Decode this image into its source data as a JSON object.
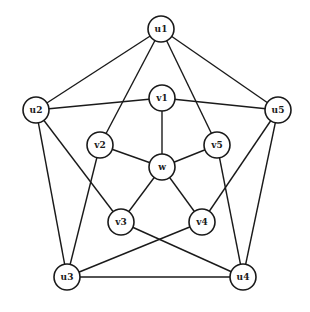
{
  "graph": {
    "node_radius": 13,
    "nodes": [
      {
        "id": "u1",
        "label": "u1",
        "x": 161,
        "y": 29
      },
      {
        "id": "u2",
        "label": "u2",
        "x": 36,
        "y": 110
      },
      {
        "id": "u5",
        "label": "u5",
        "x": 278,
        "y": 110
      },
      {
        "id": "u3",
        "label": "u3",
        "x": 67,
        "y": 277
      },
      {
        "id": "u4",
        "label": "u4",
        "x": 243,
        "y": 277
      },
      {
        "id": "v1",
        "label": "v1",
        "x": 162,
        "y": 98
      },
      {
        "id": "v2",
        "label": "v2",
        "x": 100,
        "y": 145
      },
      {
        "id": "v5",
        "label": "v5",
        "x": 217,
        "y": 145
      },
      {
        "id": "w",
        "label": "w",
        "x": 162,
        "y": 167
      },
      {
        "id": "v3",
        "label": "v3",
        "x": 121,
        "y": 222
      },
      {
        "id": "v4",
        "label": "v4",
        "x": 202,
        "y": 222
      }
    ],
    "edges": [
      [
        "u1",
        "u2"
      ],
      [
        "u1",
        "u5"
      ],
      [
        "u1",
        "v2"
      ],
      [
        "u1",
        "v5"
      ],
      [
        "u2",
        "v1"
      ],
      [
        "u2",
        "u3"
      ],
      [
        "u2",
        "v3"
      ],
      [
        "u5",
        "v1"
      ],
      [
        "u5",
        "v4"
      ],
      [
        "u5",
        "u4"
      ],
      [
        "u3",
        "v2"
      ],
      [
        "u3",
        "v4"
      ],
      [
        "u3",
        "u4"
      ],
      [
        "u4",
        "v3"
      ],
      [
        "u4",
        "v5"
      ],
      [
        "w",
        "v1"
      ],
      [
        "w",
        "v2"
      ],
      [
        "w",
        "v3"
      ],
      [
        "w",
        "v4"
      ],
      [
        "w",
        "v5"
      ]
    ]
  }
}
